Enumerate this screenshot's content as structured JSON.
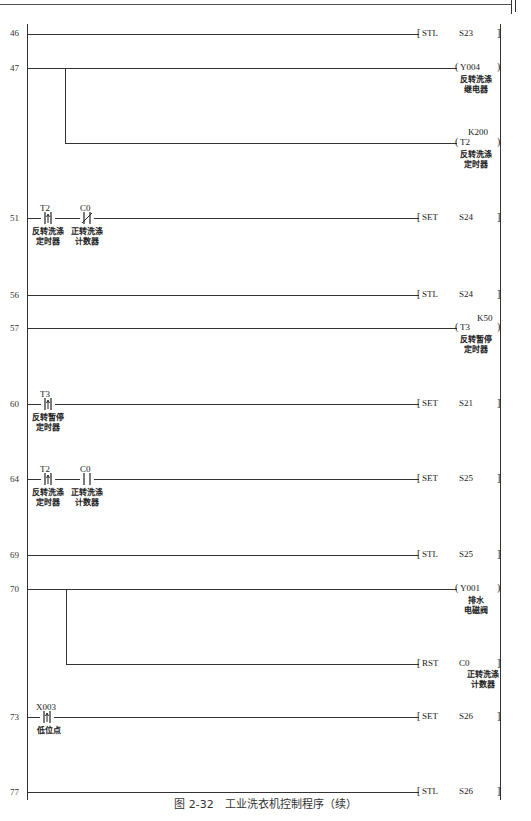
{
  "figure": {
    "caption": "图 2-32　工业洗衣机控制程序（续）"
  },
  "rungs": [
    {
      "step": "46",
      "y": 34,
      "output": {
        "kind": "func",
        "instr": "STL",
        "operand": "S23"
      }
    },
    {
      "step": "47",
      "y": 68,
      "output": {
        "kind": "coil",
        "device": "Y004",
        "label": "反转洗涤\n继电器"
      }
    },
    {
      "step": "",
      "y": 143,
      "output": {
        "kind": "coil",
        "device": "T2",
        "preset": "K200",
        "label": "反转洗涤\n定时器"
      }
    },
    {
      "step": "51",
      "y": 218,
      "contacts": [
        {
          "device": "T2",
          "type": "rising-edge",
          "label": "反转洗涤\n定时器"
        },
        {
          "device": "C0",
          "type": "normally-closed",
          "label": "正转洗涤\n计数器"
        }
      ],
      "output": {
        "kind": "func",
        "instr": "SET",
        "operand": "S24"
      }
    },
    {
      "step": "56",
      "y": 295,
      "output": {
        "kind": "func",
        "instr": "STL",
        "operand": "S24"
      }
    },
    {
      "step": "57",
      "y": 328,
      "output": {
        "kind": "coil",
        "device": "T3",
        "preset": "K50",
        "label": "反转暂停\n定时器"
      }
    },
    {
      "step": "60",
      "y": 404,
      "contacts": [
        {
          "device": "T3",
          "type": "rising-edge",
          "label": "反转暂停\n定时器"
        }
      ],
      "output": {
        "kind": "func",
        "instr": "SET",
        "operand": "S21"
      }
    },
    {
      "step": "64",
      "y": 479,
      "contacts": [
        {
          "device": "T2",
          "type": "rising-edge",
          "label": "反转洗涤\n定时器"
        },
        {
          "device": "C0",
          "type": "normally-open",
          "label": "正转洗涤\n计数器"
        }
      ],
      "output": {
        "kind": "func",
        "instr": "SET",
        "operand": "S25"
      }
    },
    {
      "step": "69",
      "y": 555,
      "output": {
        "kind": "func",
        "instr": "STL",
        "operand": "S25"
      }
    },
    {
      "step": "70",
      "y": 589,
      "output": {
        "kind": "coil",
        "device": "Y001",
        "label": "排水\n电磁阀"
      }
    },
    {
      "step": "",
      "y": 664,
      "output": {
        "kind": "func",
        "instr": "RST",
        "operand": "C0",
        "label": "正转洗涤\n计数器"
      }
    },
    {
      "step": "73",
      "y": 717,
      "contacts": [
        {
          "device": "X003",
          "type": "rising-edge",
          "label": "低位点"
        }
      ],
      "output": {
        "kind": "func",
        "instr": "SET",
        "operand": "S26"
      }
    },
    {
      "step": "77",
      "y": 792,
      "output": {
        "kind": "func",
        "instr": "STL",
        "operand": "S26"
      }
    }
  ],
  "labels": {
    "r46_step": "46",
    "r46_instr": "STL",
    "r46_op": "S23",
    "r47_step": "47",
    "r47_dev": "Y004",
    "r47_label": "反转洗涤\n继电器",
    "r47b_preset": "K200",
    "r47b_dev": "T2",
    "r47b_label": "反转洗涤\n定时器",
    "r51_step": "51",
    "r51_c1": "T2",
    "r51_c1_label": "反转洗涤\n定时器",
    "r51_c2": "C0",
    "r51_c2_label": "正转洗涤\n计数器",
    "r51_instr": "SET",
    "r51_op": "S24",
    "r56_step": "56",
    "r56_instr": "STL",
    "r56_op": "S24",
    "r57_step": "57",
    "r57_preset": "K50",
    "r57_dev": "T3",
    "r57_label": "反转暂停\n定时器",
    "r60_step": "60",
    "r60_c1": "T3",
    "r60_c1_label": "反转暂停\n定时器",
    "r60_instr": "SET",
    "r60_op": "S21",
    "r64_step": "64",
    "r64_c1": "T2",
    "r64_c1_label": "反转洗涤\n定时器",
    "r64_c2": "C0",
    "r64_c2_label": "正转洗涤\n计数器",
    "r64_instr": "SET",
    "r64_op": "S25",
    "r69_step": "69",
    "r69_instr": "STL",
    "r69_op": "S25",
    "r70_step": "70",
    "r70_dev": "Y001",
    "r70_label": "排水\n电磁阀",
    "r70b_instr": "RST",
    "r70b_op": "C0",
    "r70b_label": "正转洗涤\n计数器",
    "r73_step": "73",
    "r73_c1": "X003",
    "r73_c1_label": "低位点",
    "r73_instr": "SET",
    "r73_op": "S26",
    "r77_step": "77",
    "r77_instr": "STL",
    "r77_op": "S26"
  }
}
